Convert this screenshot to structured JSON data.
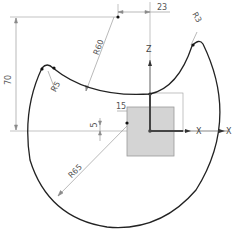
{
  "sketch": {
    "colors": {
      "profile": "#222222",
      "dimension": "#8a8a8a",
      "axis": "#555555",
      "block_fill": "#d4d4d4",
      "block_stroke": "#9a9a9a",
      "point": "#111111"
    },
    "dimensions": {
      "horizontal_top": "23",
      "vertical_left": "70",
      "radius_large_top": "R60",
      "radius_small_left": "R5",
      "radius_small_right": "R3",
      "horizontal_small": "15",
      "vertical_small": "5",
      "radius_big_arc": "R65"
    },
    "axes": {
      "z_label": "Z",
      "x_label": "X",
      "x_label_far": "X"
    }
  }
}
